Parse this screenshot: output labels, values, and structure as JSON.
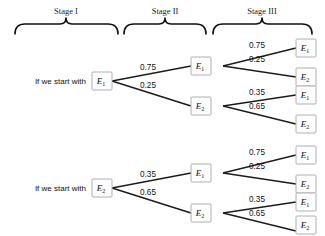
{
  "diagram": {
    "type": "probability-tree",
    "background_color": "#ffffff",
    "line_color": "#1c1c1c",
    "box_border_color": "#b0b0b0",
    "text_color": "#111111",
    "stages": [
      {
        "id": "stage-1",
        "label": "Stage I"
      },
      {
        "id": "stage-2",
        "label": "Stage II"
      },
      {
        "id": "stage-3",
        "label": "Stage III"
      }
    ],
    "prompts": [
      {
        "id": "prompt-top",
        "text": "If we start with"
      },
      {
        "id": "prompt-bottom",
        "text": "If we start with"
      }
    ],
    "trees": [
      {
        "id": "tree-from-e1",
        "root": {
          "label": "E",
          "subscript": "1"
        },
        "branches": [
          {
            "id": "e1-to-e1",
            "probability": "0.75",
            "node": {
              "label": "E",
              "subscript": "1"
            },
            "children": [
              {
                "id": "e1-e1-e1",
                "probability": "0.75",
                "node": {
                  "label": "E",
                  "subscript": "1"
                }
              },
              {
                "id": "e1-e1-e2",
                "probability": "0.25",
                "node": {
                  "label": "E",
                  "subscript": "2"
                }
              }
            ]
          },
          {
            "id": "e1-to-e2",
            "probability": "0.25",
            "node": {
              "label": "E",
              "subscript": "2"
            },
            "children": [
              {
                "id": "e1-e2-e1",
                "probability": "0.35",
                "node": {
                  "label": "E",
                  "subscript": "1"
                }
              },
              {
                "id": "e1-e2-e2",
                "probability": "0.65",
                "node": {
                  "label": "E",
                  "subscript": "2"
                }
              }
            ]
          }
        ]
      },
      {
        "id": "tree-from-e2",
        "root": {
          "label": "E",
          "subscript": "2"
        },
        "branches": [
          {
            "id": "e2-to-e1",
            "probability": "0.35",
            "node": {
              "label": "E",
              "subscript": "1"
            },
            "children": [
              {
                "id": "e2-e1-e1",
                "probability": "0.75",
                "node": {
                  "label": "E",
                  "subscript": "1"
                }
              },
              {
                "id": "e2-e1-e2",
                "probability": "0.25",
                "node": {
                  "label": "E",
                  "subscript": "2"
                }
              }
            ]
          },
          {
            "id": "e2-to-e2",
            "probability": "0.65",
            "node": {
              "label": "E",
              "subscript": "2"
            },
            "children": [
              {
                "id": "e2-e2-e1",
                "probability": "0.35",
                "node": {
                  "label": "E",
                  "subscript": "1"
                }
              },
              {
                "id": "e2-e2-e2",
                "probability": "0.65",
                "node": {
                  "label": "E",
                  "subscript": "2"
                }
              }
            ]
          }
        ]
      }
    ]
  }
}
